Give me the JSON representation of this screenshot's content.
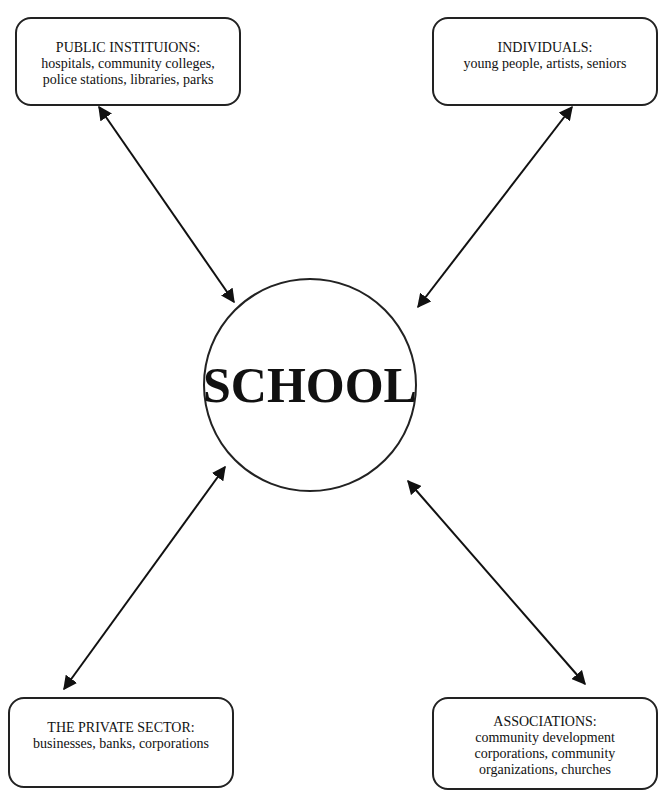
{
  "diagram": {
    "center": {
      "label": "SCHOOL"
    },
    "nodes": [
      {
        "id": "public-institutions",
        "title": "PUBLIC INSTITUIONS:",
        "lines": [
          "hospitals, community colleges,",
          "police stations, libraries, parks"
        ]
      },
      {
        "id": "individuals",
        "title": "INDIVIDUALS:",
        "lines": [
          "young people, artists, seniors"
        ]
      },
      {
        "id": "private-sector",
        "title": "THE PRIVATE SECTOR:",
        "lines": [
          "businesses, banks, corporations"
        ]
      },
      {
        "id": "associations",
        "title": "ASSOCIATIONS:",
        "lines": [
          "community development",
          "corporations, community",
          "organizations, churches"
        ]
      }
    ],
    "edges": [
      {
        "from": "SCHOOL",
        "to": "public-institutions",
        "direction": "bidirectional"
      },
      {
        "from": "SCHOOL",
        "to": "individuals",
        "direction": "bidirectional"
      },
      {
        "from": "SCHOOL",
        "to": "private-sector",
        "direction": "bidirectional"
      },
      {
        "from": "SCHOOL",
        "to": "associations",
        "direction": "bidirectional"
      }
    ]
  }
}
